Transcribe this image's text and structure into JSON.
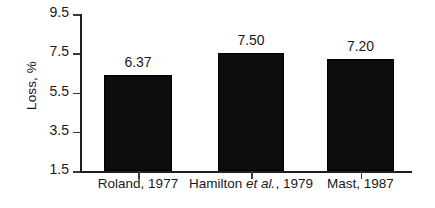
{
  "chart_data": {
    "type": "bar",
    "title": "",
    "xlabel": "",
    "ylabel": "Loss, %",
    "categories": [
      "Roland, 1977",
      "Hamilton et al., 1979",
      "Mast, 1987"
    ],
    "category_parts": [
      {
        "pre": "Roland, 1977",
        "italic": "",
        "post": ""
      },
      {
        "pre": "Hamilton ",
        "italic": "et al.",
        "post": ", 1979"
      },
      {
        "pre": "Mast, 1987",
        "italic": "",
        "post": ""
      }
    ],
    "values": [
      6.37,
      7.5,
      7.2
    ],
    "value_labels": [
      "6.37",
      "7.50",
      "7.20"
    ],
    "ylim": [
      1.5,
      9.5
    ],
    "yticks": [
      9.5,
      7.5,
      5.5,
      3.5,
      1.5
    ],
    "ytick_labels": [
      "9.5",
      "7.5",
      "5.5",
      "3.5",
      "1.5"
    ],
    "grid": false,
    "legend": false,
    "bar_color": "#0d0d0d",
    "axis_color": "#1f1f1f",
    "text_color": "#1a1a1a",
    "background": "#ffffff"
  }
}
